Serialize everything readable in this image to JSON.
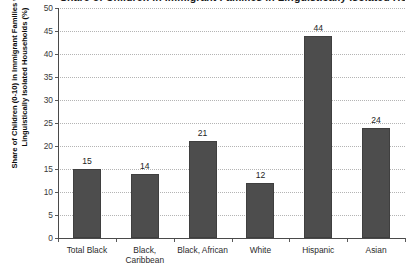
{
  "chart_data": {
    "type": "bar",
    "title": "Share of Children in Immigrant Families in Linguistically Isolated Households",
    "title_visible": false,
    "xlabel": "",
    "ylabel": "Share of Children (0-10) in Immigrant Families with Linguistically Isolated Households (%)",
    "ylabel_lines": [
      "Share of Children (0-10) in Immigrant Families with",
      "Linguistically Isolated Households (%)"
    ],
    "categories": [
      "Total Black",
      "Black, Caribbean",
      "Black, African",
      "White",
      "Hispanic",
      "Asian"
    ],
    "category_lines": [
      [
        "Total Black"
      ],
      [
        "Black,",
        "Caribbean"
      ],
      [
        "Black, African"
      ],
      [
        "White"
      ],
      [
        "Hispanic"
      ],
      [
        "Asian"
      ]
    ],
    "values": [
      15,
      14,
      21,
      12,
      44,
      24
    ],
    "data_labels": [
      "15",
      "14",
      "21",
      "12",
      "44",
      "24"
    ],
    "ylim": [
      0,
      50
    ],
    "ytick_step": 5,
    "yticks": [
      50,
      45,
      40,
      35,
      30,
      25,
      20,
      15,
      10,
      5,
      0
    ],
    "ytick_labels": [
      "50",
      "45",
      "40",
      "35",
      "30",
      "25",
      "20",
      "15",
      "10",
      "5",
      "0"
    ],
    "grid": true,
    "grid_style": "dotted",
    "legend": false,
    "legend_position": "none",
    "colors": {
      "bar_fill": "#4d4d4d",
      "bar_border": "#3f3f3f",
      "gridline": "#b4b4b4",
      "axis_line": "#4a4a4a",
      "background": "#ffffff",
      "tick_text": "#3a3a3a",
      "label_text": "#0d0d0d"
    }
  }
}
